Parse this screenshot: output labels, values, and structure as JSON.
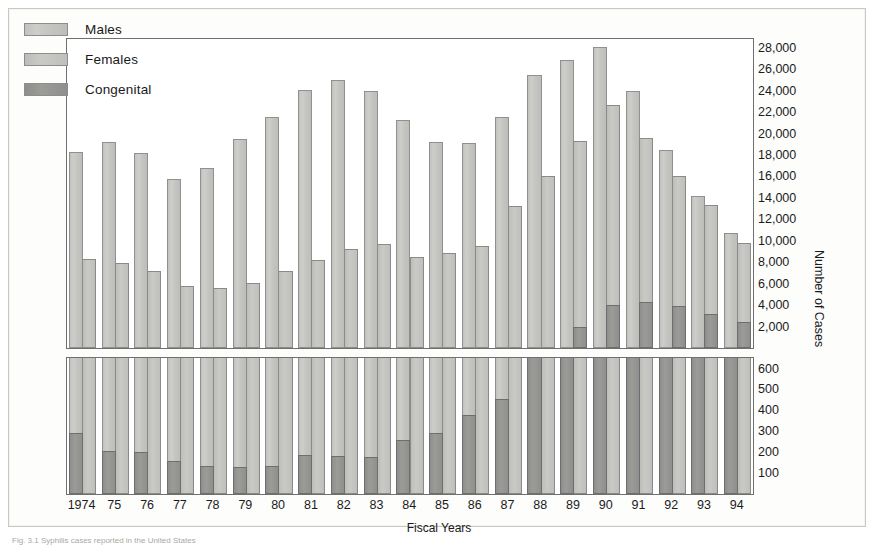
{
  "figure": {
    "caption": "Fig. 3.1 Syphilis cases reported in the United States"
  },
  "legend": {
    "position": "top-left",
    "items": [
      {
        "label": "Males",
        "color": "#c7c7c4",
        "key": "males"
      },
      {
        "label": "Females",
        "color": "#c9c9c5",
        "key": "females"
      },
      {
        "label": "Congenital",
        "color": "#939391",
        "key": "congenital"
      }
    ]
  },
  "axes": {
    "x_title": "Fiscal Years",
    "y_title": "Number of Cases",
    "upper_ticks": [
      "28,000",
      "26,000",
      "24,000",
      "22,000",
      "20,000",
      "18,000",
      "16,000",
      "14,000",
      "12,000",
      "10,000",
      "8,000",
      "6,000",
      "4,000",
      "2,000"
    ],
    "lower_ticks": [
      "600",
      "500",
      "400",
      "300",
      "200",
      "100"
    ],
    "upper_range": [
      0,
      29000
    ],
    "lower_range": [
      0,
      660
    ]
  },
  "chart_data": {
    "type": "bar",
    "title": "",
    "subtitle": "",
    "xlabel": "Fiscal Years",
    "ylabel": "Number of Cases",
    "grid": false,
    "legend_position": "top-left",
    "broken_axis": true,
    "upper_panel_ylim": [
      0,
      29000
    ],
    "lower_panel_ylim": [
      0,
      660
    ],
    "categories": [
      "1974",
      "75",
      "76",
      "77",
      "78",
      "79",
      "80",
      "81",
      "82",
      "83",
      "84",
      "85",
      "86",
      "87",
      "88",
      "89",
      "90",
      "91",
      "92",
      "93",
      "94"
    ],
    "series": [
      {
        "name": "Males",
        "panel": "upper",
        "values": [
          18300,
          19200,
          18200,
          15800,
          16800,
          19500,
          21500,
          24100,
          25000,
          24000,
          21300,
          19200,
          19100,
          21500,
          25500,
          26900,
          28100,
          24000,
          18500,
          14200,
          10700
        ]
      },
      {
        "name": "Females",
        "panel": "upper",
        "values": [
          8300,
          7900,
          7200,
          5800,
          5600,
          6100,
          7200,
          8200,
          9200,
          9700,
          8500,
          8900,
          9500,
          13200,
          16000,
          19300,
          22700,
          19600,
          16000,
          13300,
          9800
        ]
      },
      {
        "name": "Congenital",
        "panel": "lower",
        "values": [
          290,
          205,
          200,
          160,
          135,
          130,
          135,
          185,
          180,
          175,
          260,
          290,
          380,
          455,
          700,
          700,
          700,
          700,
          700,
          700,
          700
        ]
      },
      {
        "name": "Congenital (upper-panel overlay)",
        "panel": "upper",
        "values": [
          0,
          0,
          0,
          0,
          0,
          0,
          0,
          0,
          0,
          0,
          0,
          0,
          0,
          0,
          0,
          2000,
          4000,
          4300,
          3900,
          3200,
          2400
        ]
      }
    ]
  }
}
